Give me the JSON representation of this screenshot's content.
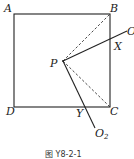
{
  "figure": {
    "caption": "图 Y8-2-1",
    "points": {
      "A": "A",
      "B": "B",
      "C": "C",
      "D": "D",
      "P": "P",
      "X": "X",
      "Y": "Y",
      "O1": "O",
      "O1_sub": "1",
      "O2": "O",
      "O2_sub": "2"
    },
    "line_color": "#222222"
  }
}
